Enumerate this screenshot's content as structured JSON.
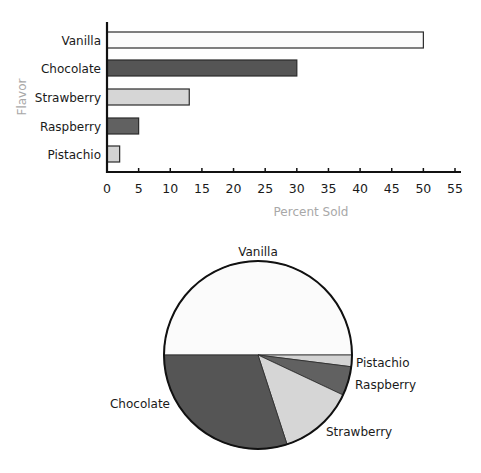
{
  "chart_data": [
    {
      "type": "bar",
      "orientation": "horizontal",
      "title": "",
      "xlabel": "Percent Sold",
      "ylabel": "Flavor",
      "categories": [
        "Vanilla",
        "Chocolate",
        "Strawberry",
        "Raspberry",
        "Pistachio"
      ],
      "values": [
        50,
        30,
        13,
        5,
        2
      ],
      "colors": [
        "#fbfbfb",
        "#555555",
        "#d6d6d6",
        "#616161",
        "#d3d3d3"
      ],
      "xlim": [
        0,
        57
      ],
      "xticks": [
        "0",
        "5",
        "10",
        "15",
        "20",
        "25",
        "30",
        "35",
        "40",
        "45",
        "50",
        "55"
      ],
      "grid": false,
      "legend": "none"
    },
    {
      "type": "pie",
      "title": "",
      "categories": [
        "Vanilla",
        "Pistachio",
        "Raspberry",
        "Strawberry",
        "Chocolate"
      ],
      "values": [
        50,
        2,
        5,
        13,
        30
      ],
      "colors": [
        "#fbfbfb",
        "#d3d3d3",
        "#616161",
        "#d6d6d6",
        "#555555"
      ],
      "legend": "none",
      "labels_outside": true
    }
  ]
}
